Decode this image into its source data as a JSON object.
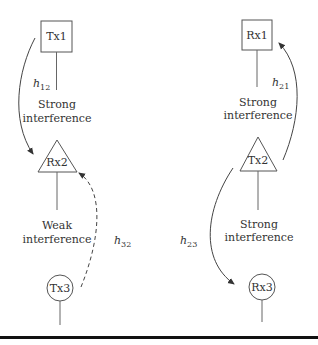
{
  "diagram": {
    "left_column": {
      "tx1": {
        "label": "Tx1",
        "shape": "square"
      },
      "link_1_2": {
        "channel": "h",
        "subscript": "12",
        "description_line1": "Strong",
        "description_line2": "interference"
      },
      "rx2": {
        "label": "Rx2",
        "shape": "triangle"
      },
      "link_3_2": {
        "channel": "h",
        "subscript": "32",
        "description_line1": "Weak",
        "description_line2": "interference",
        "style": "dashed"
      },
      "tx3": {
        "label": "Tx3",
        "shape": "circle"
      }
    },
    "right_column": {
      "rx1": {
        "label": "Rx1",
        "shape": "square"
      },
      "link_2_1": {
        "channel": "h",
        "subscript": "21",
        "description_line1": "Strong",
        "description_line2": "interference"
      },
      "tx2": {
        "label": "Tx2",
        "shape": "triangle"
      },
      "link_2_3": {
        "channel": "h",
        "subscript": "23",
        "description_line1": "Strong",
        "description_line2": "interference"
      },
      "rx3": {
        "label": "Rx3",
        "shape": "circle"
      }
    },
    "colors": {
      "stroke": "#333333",
      "background": "#ffffff",
      "baseline": "#111111"
    }
  }
}
